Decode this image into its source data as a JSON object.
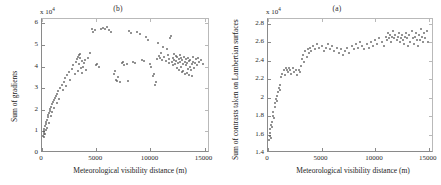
{
  "figure": {
    "width": 441,
    "height": 185,
    "background": "#ffffff",
    "point_color": "#555555",
    "axis_color": "#8a8a8a"
  },
  "panels": [
    {
      "id": "panel-b",
      "title": "(b)",
      "xlabel": "Meteorological visibility distance (m)",
      "ylabel": "Sum of gradients",
      "y_exponent_label": "x 10",
      "y_exponent_power": "4",
      "xticks": [
        "0",
        "5000",
        "10000",
        "15000"
      ],
      "xtick_values": [
        0,
        5000,
        10000,
        15000
      ],
      "yticks": [
        "0",
        "1",
        "2",
        "3",
        "4",
        "5",
        "6"
      ],
      "ytick_values": [
        0,
        10000,
        20000,
        30000,
        40000,
        50000,
        60000
      ],
      "xlim": [
        0,
        15500
      ],
      "ylim": [
        0,
        62000
      ]
    },
    {
      "id": "panel-a",
      "title": "(a)",
      "xlabel": "Meteorological visibility distance (m)",
      "ylabel": "Sum of contrasts taken on Lambertian surfaces",
      "y_exponent_label": "x 10",
      "y_exponent_power": "4",
      "xticks": [
        "0",
        "5000",
        "10000",
        "15000"
      ],
      "xtick_values": [
        0,
        5000,
        10000,
        15000
      ],
      "yticks": [
        "1.4",
        "1.6",
        "1.8",
        "2",
        "2.2",
        "2.4",
        "2.6",
        "2.8"
      ],
      "ytick_values": [
        14000,
        16000,
        18000,
        20000,
        22000,
        24000,
        26000,
        28000
      ],
      "xlim": [
        0,
        15500
      ],
      "ylim": [
        14000,
        28500
      ]
    }
  ],
  "chart_data": [
    {
      "type": "scatter",
      "title": "(b)",
      "xlabel": "Meteorological visibility distance (m)",
      "ylabel": "Sum of gradients",
      "xlim": [
        0,
        15500
      ],
      "ylim": [
        0,
        62000
      ],
      "y_scale_multiplier": 10000,
      "grid": false,
      "legend": null,
      "points": [
        [
          120,
          8000
        ],
        [
          140,
          8800
        ],
        [
          160,
          9500
        ],
        [
          180,
          10200
        ],
        [
          200,
          7600
        ],
        [
          220,
          11000
        ],
        [
          260,
          9000
        ],
        [
          300,
          12500
        ],
        [
          330,
          10500
        ],
        [
          360,
          13500
        ],
        [
          400,
          14500
        ],
        [
          430,
          11500
        ],
        [
          470,
          15500
        ],
        [
          520,
          16500
        ],
        [
          560,
          17500
        ],
        [
          600,
          14000
        ],
        [
          640,
          18500
        ],
        [
          700,
          19500
        ],
        [
          760,
          20500
        ],
        [
          800,
          17000
        ],
        [
          860,
          21500
        ],
        [
          900,
          22500
        ],
        [
          950,
          19000
        ],
        [
          1000,
          23500
        ],
        [
          1080,
          24500
        ],
        [
          1150,
          21000
        ],
        [
          1200,
          25500
        ],
        [
          1280,
          26500
        ],
        [
          1350,
          23000
        ],
        [
          1420,
          27500
        ],
        [
          1500,
          28500
        ],
        [
          1600,
          25000
        ],
        [
          1700,
          30000
        ],
        [
          1800,
          31500
        ],
        [
          1900,
          29000
        ],
        [
          2000,
          33000
        ],
        [
          2100,
          34500
        ],
        [
          2200,
          31000
        ],
        [
          2350,
          36000
        ],
        [
          2500,
          37500
        ],
        [
          2600,
          34000
        ],
        [
          2750,
          39000
        ],
        [
          2900,
          40500
        ],
        [
          3000,
          36500
        ],
        [
          3100,
          42000
        ],
        [
          3200,
          43500
        ],
        [
          3300,
          38000
        ],
        [
          3350,
          44500
        ],
        [
          3400,
          45500
        ],
        [
          3450,
          41000
        ],
        [
          3500,
          46000
        ],
        [
          3550,
          44000
        ],
        [
          3600,
          39500
        ],
        [
          3650,
          42500
        ],
        [
          3700,
          37000
        ],
        [
          3800,
          40000
        ],
        [
          3900,
          41500
        ],
        [
          4000,
          43000
        ],
        [
          4100,
          38500
        ],
        [
          4200,
          44000
        ],
        [
          4400,
          46500
        ],
        [
          4600,
          57500
        ],
        [
          4700,
          56000
        ],
        [
          4850,
          57000
        ],
        [
          5000,
          40500
        ],
        [
          5100,
          41000
        ],
        [
          5250,
          40000
        ],
        [
          5400,
          57500
        ],
        [
          5600,
          58000
        ],
        [
          5800,
          57500
        ],
        [
          6000,
          58500
        ],
        [
          6200,
          57000
        ],
        [
          6400,
          56000
        ],
        [
          6600,
          36500
        ],
        [
          6700,
          38000
        ],
        [
          6800,
          34000
        ],
        [
          6900,
          33500
        ],
        [
          7000,
          35000
        ],
        [
          7200,
          33000
        ],
        [
          7400,
          41500
        ],
        [
          7500,
          42000
        ],
        [
          7600,
          40500
        ],
        [
          7800,
          41000
        ],
        [
          7900,
          33500
        ],
        [
          8000,
          56500
        ],
        [
          8200,
          55500
        ],
        [
          8400,
          42000
        ],
        [
          8600,
          41500
        ],
        [
          8800,
          56000
        ],
        [
          9000,
          55000
        ],
        [
          9200,
          43000
        ],
        [
          9400,
          42500
        ],
        [
          9600,
          53500
        ],
        [
          9800,
          52500
        ],
        [
          10000,
          41000
        ],
        [
          10100,
          40000
        ],
        [
          10200,
          35500
        ],
        [
          10300,
          36500
        ],
        [
          10400,
          31500
        ],
        [
          10500,
          33000
        ],
        [
          10600,
          43500
        ],
        [
          10700,
          51000
        ],
        [
          10800,
          45000
        ],
        [
          10900,
          44000
        ],
        [
          11000,
          46500
        ],
        [
          11100,
          43000
        ],
        [
          11200,
          49000
        ],
        [
          11300,
          44500
        ],
        [
          11400,
          42500
        ],
        [
          11500,
          48000
        ],
        [
          11600,
          45500
        ],
        [
          11700,
          41500
        ],
        [
          11750,
          43500
        ],
        [
          11800,
          53000
        ],
        [
          11900,
          54000
        ],
        [
          12000,
          42000
        ],
        [
          12050,
          44000
        ],
        [
          12100,
          40500
        ],
        [
          12150,
          46000
        ],
        [
          12200,
          43000
        ],
        [
          12300,
          41000
        ],
        [
          12350,
          45000
        ],
        [
          12400,
          42500
        ],
        [
          12450,
          39500
        ],
        [
          12500,
          44500
        ],
        [
          12550,
          41500
        ],
        [
          12600,
          43500
        ],
        [
          12650,
          38500
        ],
        [
          12700,
          45500
        ],
        [
          12750,
          42000
        ],
        [
          12800,
          40000
        ],
        [
          12850,
          44000
        ],
        [
          12900,
          37500
        ],
        [
          12950,
          43000
        ],
        [
          13000,
          41000
        ],
        [
          13050,
          38000
        ],
        [
          13100,
          44500
        ],
        [
          13150,
          42000
        ],
        [
          13200,
          36500
        ],
        [
          13250,
          40500
        ],
        [
          13300,
          43500
        ],
        [
          13350,
          37000
        ],
        [
          13400,
          41500
        ],
        [
          13450,
          39000
        ],
        [
          13500,
          44000
        ],
        [
          13550,
          42500
        ],
        [
          13600,
          36000
        ],
        [
          13650,
          40000
        ],
        [
          13700,
          43000
        ],
        [
          13750,
          38500
        ],
        [
          13800,
          41000
        ],
        [
          13850,
          35500
        ],
        [
          13900,
          42000
        ],
        [
          13950,
          44500
        ],
        [
          14000,
          39500
        ],
        [
          14100,
          41500
        ],
        [
          14200,
          43500
        ],
        [
          14300,
          40500
        ],
        [
          14400,
          44000
        ],
        [
          14500,
          42000
        ],
        [
          14700,
          43000
        ],
        [
          14900,
          41000
        ]
      ]
    },
    {
      "type": "scatter",
      "title": "(a)",
      "xlabel": "Meteorological visibility distance (m)",
      "ylabel": "Sum of contrasts taken on Lambertian surfaces",
      "xlim": [
        0,
        15500
      ],
      "ylim": [
        14000,
        28500
      ],
      "y_scale_multiplier": 10000,
      "grid": false,
      "legend": null,
      "points": [
        [
          120,
          15400
        ],
        [
          150,
          15800
        ],
        [
          180,
          16200
        ],
        [
          210,
          16600
        ],
        [
          250,
          15600
        ],
        [
          300,
          17000
        ],
        [
          350,
          17400
        ],
        [
          400,
          16800
        ],
        [
          450,
          18000
        ],
        [
          500,
          18400
        ],
        [
          560,
          17800
        ],
        [
          620,
          19000
        ],
        [
          680,
          19400
        ],
        [
          740,
          19800
        ],
        [
          800,
          20200
        ],
        [
          860,
          19600
        ],
        [
          920,
          20600
        ],
        [
          1000,
          21000
        ],
        [
          1080,
          20800
        ],
        [
          1150,
          21400
        ],
        [
          1250,
          22200
        ],
        [
          1350,
          22600
        ],
        [
          1450,
          23000
        ],
        [
          1550,
          22400
        ],
        [
          1650,
          23200
        ],
        [
          1750,
          23000
        ],
        [
          1850,
          22800
        ],
        [
          1950,
          23200
        ],
        [
          2050,
          23000
        ],
        [
          2150,
          22600
        ],
        [
          2300,
          23200
        ],
        [
          2450,
          22800
        ],
        [
          2600,
          23000
        ],
        [
          2750,
          22400
        ],
        [
          2900,
          23000
        ],
        [
          3000,
          22800
        ],
        [
          3100,
          23400
        ],
        [
          3200,
          24200
        ],
        [
          3300,
          24600
        ],
        [
          3400,
          23800
        ],
        [
          3500,
          25000
        ],
        [
          3600,
          24400
        ],
        [
          3700,
          25200
        ],
        [
          3800,
          24800
        ],
        [
          3900,
          25400
        ],
        [
          4000,
          25000
        ],
        [
          4200,
          25600
        ],
        [
          4400,
          25200
        ],
        [
          4600,
          25800
        ],
        [
          4800,
          25400
        ],
        [
          5000,
          25600
        ],
        [
          5200,
          25000
        ],
        [
          5400,
          25400
        ],
        [
          5600,
          25800
        ],
        [
          5800,
          25200
        ],
        [
          6000,
          25600
        ],
        [
          6200,
          25000
        ],
        [
          6400,
          25400
        ],
        [
          6600,
          24800
        ],
        [
          6800,
          25200
        ],
        [
          7000,
          24600
        ],
        [
          7200,
          25000
        ],
        [
          7400,
          25400
        ],
        [
          7600,
          24800
        ],
        [
          7800,
          25600
        ],
        [
          8000,
          25200
        ],
        [
          8200,
          25800
        ],
        [
          8400,
          25400
        ],
        [
          8600,
          26000
        ],
        [
          8800,
          25600
        ],
        [
          9000,
          25200
        ],
        [
          9200,
          25800
        ],
        [
          9400,
          25400
        ],
        [
          9600,
          26000
        ],
        [
          9800,
          25600
        ],
        [
          10000,
          26200
        ],
        [
          10200,
          25800
        ],
        [
          10400,
          26400
        ],
        [
          10600,
          26000
        ],
        [
          10800,
          25600
        ],
        [
          11000,
          26600
        ],
        [
          11100,
          26200
        ],
        [
          11200,
          27000
        ],
        [
          11300,
          26400
        ],
        [
          11400,
          26800
        ],
        [
          11500,
          26000
        ],
        [
          11600,
          26600
        ],
        [
          11700,
          27200
        ],
        [
          11800,
          26400
        ],
        [
          11900,
          26800
        ],
        [
          12000,
          26200
        ],
        [
          12100,
          26600
        ],
        [
          12200,
          27000
        ],
        [
          12300,
          26000
        ],
        [
          12400,
          26400
        ],
        [
          12500,
          26800
        ],
        [
          12600,
          26200
        ],
        [
          12700,
          25800
        ],
        [
          12800,
          26600
        ],
        [
          12900,
          27000
        ],
        [
          13000,
          26400
        ],
        [
          13100,
          25600
        ],
        [
          13200,
          26800
        ],
        [
          13300,
          26000
        ],
        [
          13400,
          27200
        ],
        [
          13500,
          26400
        ],
        [
          13600,
          25800
        ],
        [
          13700,
          26600
        ],
        [
          13800,
          27000
        ],
        [
          13900,
          26200
        ],
        [
          14000,
          25600
        ],
        [
          14100,
          26800
        ],
        [
          14200,
          26200
        ],
        [
          14300,
          27400
        ],
        [
          14400,
          26600
        ],
        [
          14500,
          26000
        ],
        [
          14600,
          27000
        ],
        [
          14700,
          26400
        ],
        [
          14800,
          27200
        ],
        [
          14900,
          26000
        ]
      ]
    }
  ]
}
